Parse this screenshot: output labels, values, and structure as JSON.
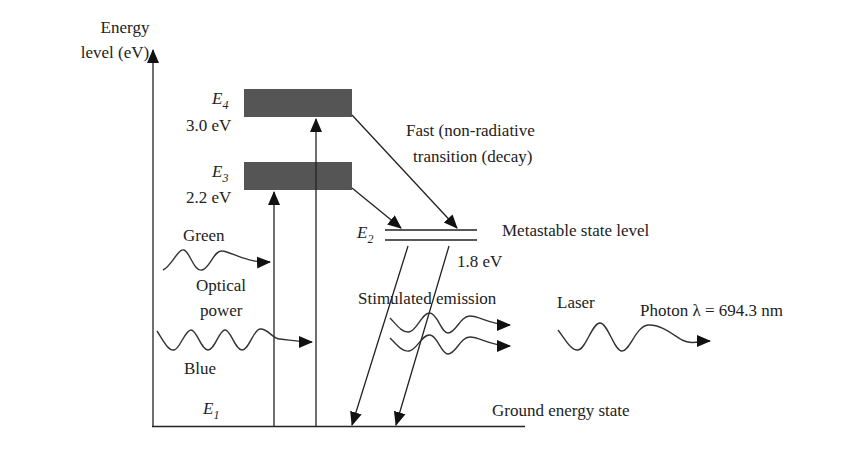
{
  "axis": {
    "label_line1": "Energy",
    "label_line2": "level (eV)"
  },
  "levels": [
    {
      "name": "E",
      "sub": "4",
      "energy": "3.0 eV",
      "type": "band"
    },
    {
      "name": "E",
      "sub": "3",
      "energy": "2.2 eV",
      "type": "band"
    },
    {
      "name": "E",
      "sub": "2",
      "energy": "1.8 eV",
      "type": "metastable",
      "description": "Metastable state level"
    },
    {
      "name": "E",
      "sub": "1",
      "description": "Ground energy state",
      "type": "ground"
    }
  ],
  "annotations": {
    "fast_line1": "Fast (non-radiative",
    "fast_line2": "transition (decay)",
    "green": "Green",
    "optical_line1": "Optical",
    "optical_line2": "power",
    "blue": "Blue",
    "stimulated": "Stimulated emission",
    "laser": "Laser",
    "photon": "Photon λ = 694.3 nm"
  },
  "colors": {
    "band": "#555555",
    "line": "#222222"
  }
}
